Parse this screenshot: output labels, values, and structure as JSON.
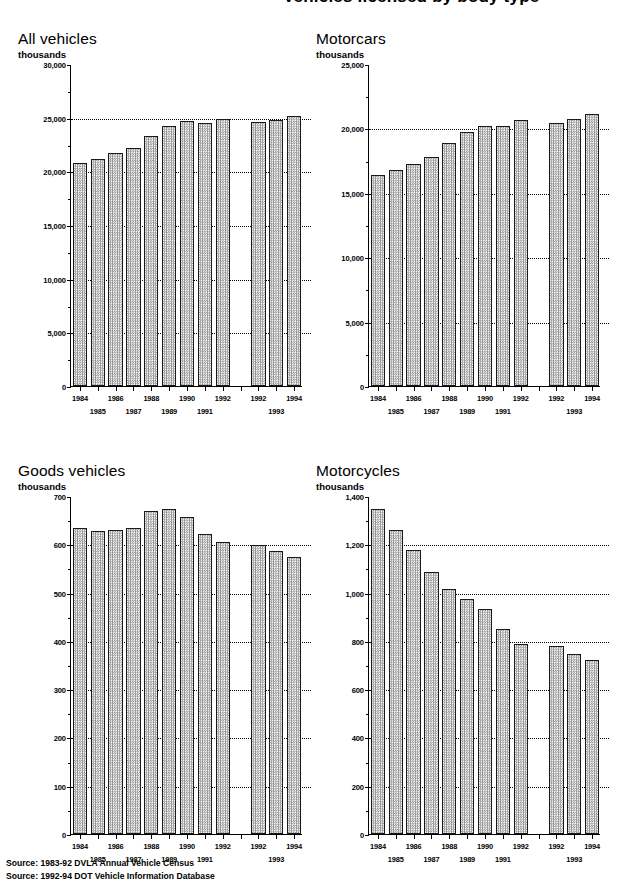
{
  "page": {
    "title": "Vehicles licensed by body type",
    "sources": [
      "Source: 1983-92 DVLA Annual Vehicle Census",
      "Source: 1992-94 DOT Vehicle Information Database"
    ]
  },
  "common": {
    "unit_label": "thousands",
    "group1_years": [
      "1984",
      "1985",
      "1986",
      "1987",
      "1988",
      "1989",
      "1990",
      "1991",
      "1992"
    ],
    "group2_years": [
      "1992",
      "1993",
      "1994"
    ],
    "row1_years": [
      "1984",
      "1986",
      "1988",
      "1990",
      "1992",
      "1992",
      "1994"
    ],
    "row2_years": [
      "1985",
      "1987",
      "1989",
      "1991",
      "1993"
    ]
  },
  "chart_data": [
    {
      "type": "bar",
      "title": "All vehicles",
      "xlabel": "",
      "ylabel": "thousands",
      "ylim": [
        0,
        30000
      ],
      "ytick_labels": [
        "0",
        "5,000",
        "10,000",
        "15,000",
        "20,000",
        "25,000",
        "30,000"
      ],
      "ytick_values": [
        0,
        5000,
        10000,
        15000,
        20000,
        25000,
        30000
      ],
      "minor_tick_step": 2500,
      "gridlines": [
        5000,
        10000,
        15000,
        20000,
        25000
      ],
      "grid": true,
      "legend": "none",
      "series": [
        {
          "name": "DVLA Annual Vehicle Census 1984-1992",
          "categories": [
            "1984",
            "1985",
            "1986",
            "1987",
            "1988",
            "1989",
            "1990",
            "1991",
            "1992"
          ],
          "values": [
            20780,
            21150,
            21700,
            22150,
            23300,
            24200,
            24670,
            24550,
            24850
          ]
        },
        {
          "name": "DOT Vehicle Information Database 1992-1994",
          "categories": [
            "1992",
            "1993",
            "1994"
          ],
          "values": [
            24600,
            24750,
            25200
          ]
        }
      ]
    },
    {
      "type": "bar",
      "title": "Motorcars",
      "xlabel": "",
      "ylabel": "thousands",
      "ylim": [
        0,
        25000
      ],
      "ytick_labels": [
        "0",
        "5,000",
        "10,000",
        "15,000",
        "20,000",
        "25,000"
      ],
      "ytick_values": [
        0,
        5000,
        10000,
        15000,
        20000,
        25000
      ],
      "minor_tick_step": 2500,
      "gridlines": [
        5000,
        10000,
        15000,
        20000
      ],
      "grid": true,
      "legend": "none",
      "series": [
        {
          "name": "DVLA Annual Vehicle Census 1984-1992",
          "categories": [
            "1984",
            "1985",
            "1986",
            "1987",
            "1988",
            "1989",
            "1990",
            "1991",
            "1992"
          ],
          "values": [
            16350,
            16750,
            17250,
            17800,
            18850,
            19700,
            20200,
            20200,
            20650
          ]
        },
        {
          "name": "DOT Vehicle Information Database 1992-1994",
          "categories": [
            "1992",
            "1993",
            "1994"
          ],
          "values": [
            20400,
            20700,
            21100
          ]
        }
      ]
    },
    {
      "type": "bar",
      "title": "Goods vehicles",
      "xlabel": "",
      "ylabel": "thousands",
      "ylim": [
        0,
        700
      ],
      "ytick_labels": [
        "0",
        "100",
        "200",
        "300",
        "400",
        "500",
        "600",
        "700"
      ],
      "ytick_values": [
        0,
        100,
        200,
        300,
        400,
        500,
        600,
        700
      ],
      "minor_tick_step": 50,
      "gridlines": [
        100,
        200,
        300,
        400,
        500,
        600
      ],
      "grid": true,
      "legend": "none",
      "series": [
        {
          "name": "DVLA Annual Vehicle Census 1984-1992",
          "categories": [
            "1984",
            "1985",
            "1986",
            "1987",
            "1988",
            "1989",
            "1990",
            "1991",
            "1992"
          ],
          "values": [
            634,
            628,
            630,
            633,
            670,
            674,
            656,
            622,
            605
          ]
        },
        {
          "name": "DOT Vehicle Information Database 1992-1994",
          "categories": [
            "1992",
            "1993",
            "1994"
          ],
          "values": [
            598,
            587,
            574
          ]
        }
      ]
    },
    {
      "type": "bar",
      "title": "Motorcycles",
      "xlabel": "",
      "ylabel": "thousands",
      "ylim": [
        0,
        1400
      ],
      "ytick_labels": [
        "0",
        "200",
        "400",
        "600",
        "800",
        "1,000",
        "1,200",
        "1,400"
      ],
      "ytick_values": [
        0,
        200,
        400,
        600,
        800,
        1000,
        1200,
        1400
      ],
      "minor_tick_step": 100,
      "gridlines": [
        200,
        400,
        600,
        800,
        1000,
        1200
      ],
      "grid": true,
      "legend": "none",
      "series": [
        {
          "name": "DVLA Annual Vehicle Census 1984-1992",
          "categories": [
            "1984",
            "1985",
            "1986",
            "1987",
            "1988",
            "1989",
            "1990",
            "1991",
            "1992"
          ],
          "values": [
            1345,
            1258,
            1178,
            1087,
            1013,
            975,
            932,
            848,
            785
          ]
        },
        {
          "name": "DOT Vehicle Information Database 1992-1994",
          "categories": [
            "1992",
            "1993",
            "1994"
          ],
          "values": [
            778,
            745,
            720
          ]
        }
      ]
    }
  ]
}
